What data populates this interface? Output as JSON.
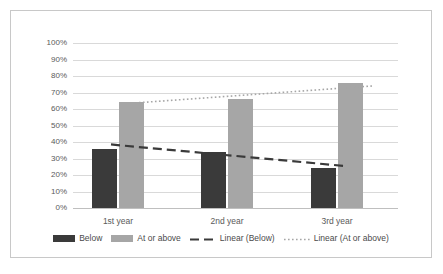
{
  "chart_data": {
    "type": "bar",
    "title": "",
    "xlabel": "",
    "ylabel": "",
    "categories": [
      "1st year",
      "2nd year",
      "3rd year"
    ],
    "series": [
      {
        "name": "Below",
        "values": [
          36,
          34,
          24
        ],
        "color": "#3a3a3a"
      },
      {
        "name": "At or above",
        "values": [
          64,
          66,
          76
        ],
        "color": "#a6a6a6"
      }
    ],
    "trendlines": [
      {
        "name": "Linear (Below)",
        "style": "dashed",
        "color": "#3a3a3a",
        "start": 38.5,
        "end": 25.5
      },
      {
        "name": "Linear (At or above)",
        "style": "dotted",
        "color": "#a6a6a6",
        "start": 63.5,
        "end": 74.0
      }
    ],
    "ylim": [
      0,
      100
    ],
    "yticks": [
      "0%",
      "10%",
      "20%",
      "30%",
      "40%",
      "50%",
      "60%",
      "70%",
      "80%",
      "90%",
      "100%"
    ],
    "ytick_values": [
      0,
      10,
      20,
      30,
      40,
      50,
      60,
      70,
      80,
      90,
      100
    ],
    "grid": true,
    "legend_position": "bottom",
    "legend": [
      "Below",
      "At or above",
      "Linear (Below)",
      "Linear (At or above)"
    ]
  },
  "yticks": {
    "t0": "0%",
    "t1": "10%",
    "t2": "20%",
    "t3": "30%",
    "t4": "40%",
    "t5": "50%",
    "t6": "60%",
    "t7": "70%",
    "t8": "80%",
    "t9": "90%",
    "t10": "100%"
  },
  "xticks": {
    "x0": "1st year",
    "x1": "2nd year",
    "x2": "3rd year"
  },
  "legend": {
    "below": "Below",
    "at_or_above": "At or above",
    "linear_below": "Linear (Below)",
    "linear_at_or_above": "Linear (At or above)"
  },
  "colors": {
    "below": "#3a3a3a",
    "at_or_above": "#a6a6a6",
    "gridline": "#d9d9d9",
    "border": "#c8c8c8",
    "text": "#5a5a5a"
  }
}
